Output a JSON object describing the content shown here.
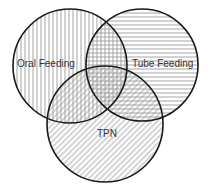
{
  "diagram": {
    "type": "venn",
    "sets": [
      {
        "id": "oral",
        "label": "Oral Feeding",
        "pattern": "vertical-lines",
        "circle": {
          "cx": 70,
          "cy": 66,
          "r": 57
        },
        "label_pos": {
          "x": 17,
          "y": 67
        }
      },
      {
        "id": "tube",
        "label": "Tube Feeding",
        "pattern": "horizontal-lines",
        "circle": {
          "cx": 142,
          "cy": 65,
          "r": 56
        },
        "label_pos": {
          "x": 132,
          "y": 67
        }
      },
      {
        "id": "tpn",
        "label": "TPN",
        "pattern": "diagonal-lines",
        "circle": {
          "cx": 105,
          "cy": 124,
          "r": 58
        },
        "label_pos": {
          "x": 97,
          "y": 137
        }
      }
    ],
    "colors": {
      "outline": "#1a1a1a",
      "hatch": "#9a9a9a",
      "text": "#333333",
      "background": "#ffffff"
    }
  }
}
